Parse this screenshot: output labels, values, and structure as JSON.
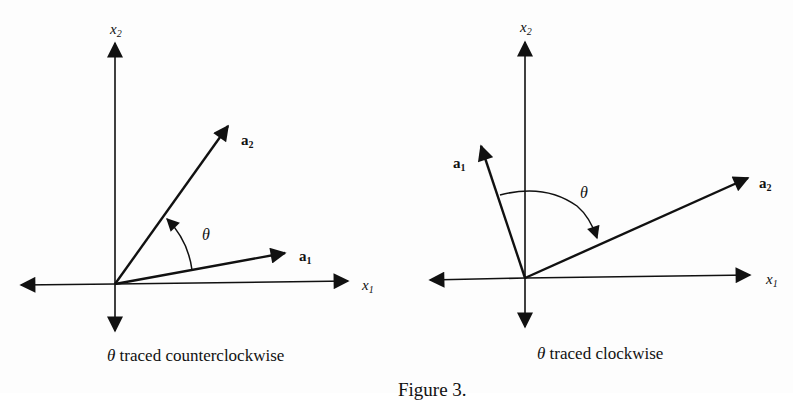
{
  "figure": {
    "caption_partial": "Figure 3.",
    "background_show_through": true,
    "panels": [
      {
        "id": "left",
        "caption_symbol": "θ",
        "caption_text": " traced counterclockwise",
        "axis_x_label": "x",
        "axis_x_sub": "1",
        "axis_y_label": "x",
        "axis_y_sub": "2",
        "vec_1_label": "a",
        "vec_1_sub": "1",
        "vec_2_label": "a",
        "vec_2_sub": "2",
        "angle_label": "θ",
        "direction": "counterclockwise"
      },
      {
        "id": "right",
        "caption_symbol": "θ",
        "caption_text": " traced clockwise",
        "axis_x_label": "x",
        "axis_x_sub": "1",
        "axis_y_label": "x",
        "axis_y_sub": "2",
        "vec_1_label": "a",
        "vec_1_sub": "1",
        "vec_2_label": "a",
        "vec_2_sub": "2",
        "angle_label": "θ",
        "direction": "clockwise"
      }
    ]
  },
  "colors": {
    "ink": "#111111",
    "paper": "#fdfdfd"
  }
}
